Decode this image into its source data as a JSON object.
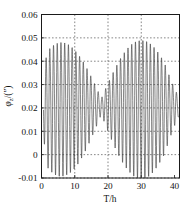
{
  "chart_data": {
    "type": "line",
    "title": "",
    "subtitle": "",
    "xlabel": "T/h",
    "ylabel": "φz/(″)",
    "ylabel_parts": {
      "symbol": "φ",
      "subscript": "z",
      "units": "/(″)"
    },
    "xlim": [
      0,
      41.5
    ],
    "ylim": [
      -0.01,
      0.06
    ],
    "xticks": [
      0,
      10,
      20,
      30,
      40
    ],
    "yticks": [
      -0.01,
      0,
      0.01,
      0.02,
      0.03,
      0.04,
      0.05,
      0.06
    ],
    "xticklabels": [
      "0",
      "10",
      "20",
      "30",
      "40"
    ],
    "yticklabels": [
      "-0.01",
      "0",
      "0.01",
      "0.02",
      "0.03",
      "0.04",
      "0.05",
      "0.06"
    ],
    "grid": true,
    "grid_style": "dotted",
    "grid_x_values": [
      10,
      20,
      30
    ],
    "grid_y_values": [
      -0.01,
      0,
      0.01,
      0.02,
      0.03,
      0.04,
      0.05
    ],
    "legend": false,
    "legend_position": "none",
    "line_color": "#3a3a3a",
    "series": [
      {
        "name": "phi_z",
        "description": "Beating oscillation: carrier period approx 1.12 h modulated by a beat envelope with node near T = 18 h",
        "mean_level": 0.0208,
        "carrier_period_h": 1.12,
        "beat_period_h": 24.0,
        "beat_node_h": 18.0,
        "envelope_max_amplitude": 0.0295,
        "envelope_min_amplitude": 0.0035,
        "y_max_observed": 0.0502,
        "y_min_observed": -0.0088,
        "x_start": 0.6,
        "x_end": 41.2,
        "samples_per_hour": 24
      }
    ],
    "annotations": []
  },
  "axes": {
    "x_title": "T/h",
    "y_title_symbol": "φ",
    "y_title_sub": "z",
    "y_title_unit": "/(″)"
  }
}
